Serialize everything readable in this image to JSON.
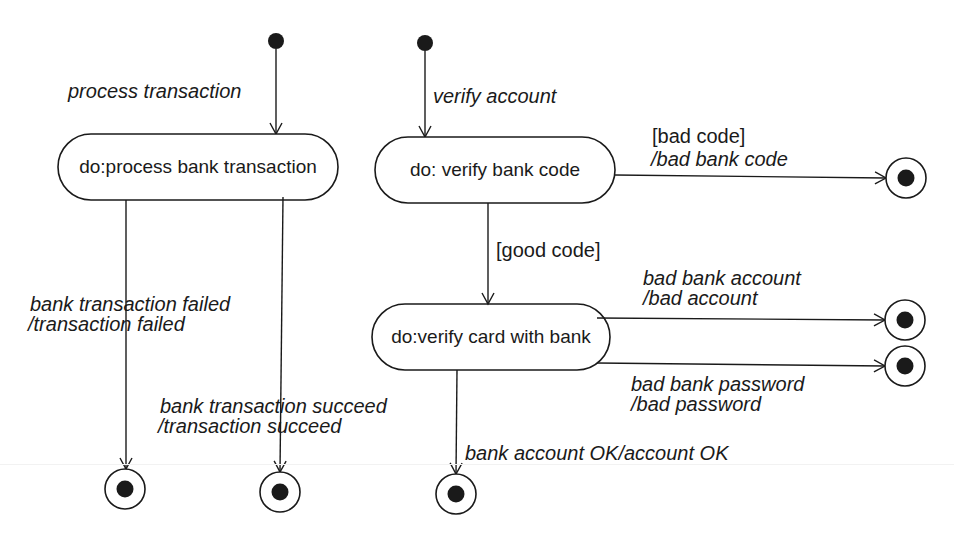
{
  "diagram": {
    "type": "UML state machine",
    "colors": {
      "stroke": "#1a1a1a",
      "background": "#ffffff"
    },
    "left_machine": {
      "initial_transition_label": "process transaction",
      "state": {
        "label": "do:process bank transaction"
      },
      "transitions": [
        {
          "label_line1": "bank transaction failed",
          "label_line2": "/transaction failed"
        },
        {
          "label_line1": "bank transaction succeed",
          "label_line2": "/transaction succeed"
        }
      ]
    },
    "right_machine": {
      "initial_transition_label": "verify account",
      "states": [
        {
          "label": "do: verify bank code"
        },
        {
          "label": "do:verify card with bank"
        }
      ],
      "transitions": [
        {
          "guard": "[bad code]",
          "action": "/bad bank code"
        },
        {
          "guard": "[good code]"
        },
        {
          "label_line1": "bad bank account",
          "label_line2": "/bad account"
        },
        {
          "label_line1": "bad bank password",
          "label_line2": "/bad password"
        },
        {
          "label": "bank account OK/account OK"
        }
      ]
    }
  }
}
